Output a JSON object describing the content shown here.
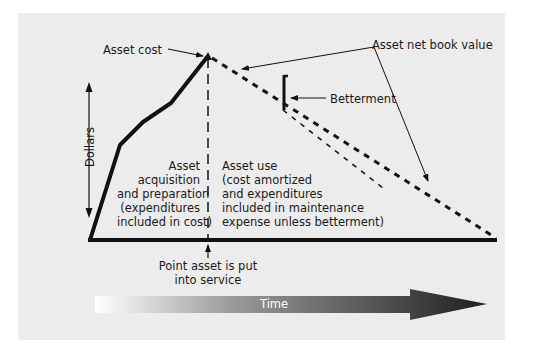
{
  "diagram": {
    "labels": {
      "asset_cost": "Asset cost",
      "asset_net_book_value": "Asset net book value",
      "betterment": "Betterment",
      "dollars": "Dollars",
      "time": "Time",
      "point_in_service_line1": "Point asset is put",
      "point_in_service_line2": "into service"
    },
    "left_region": {
      "lines": [
        "Asset",
        "acquisition",
        "and preparation",
        "(expenditures",
        "included in cost)"
      ]
    },
    "right_region": {
      "lines": [
        "Asset use",
        "(cost amortized",
        "and expenditures",
        "included in maintenance",
        "expense unless betterment)"
      ]
    },
    "colors": {
      "background": "#ececec",
      "line": "#111111",
      "arrow_start": "#ffffff",
      "arrow_end": "#1e1e1e"
    }
  }
}
